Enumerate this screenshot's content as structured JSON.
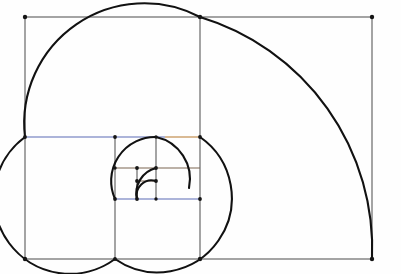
{
  "figure": {
    "name": "golden-spiral-diagram",
    "background_color": "#fefefe",
    "canvas": {
      "width": 401,
      "height": 274
    },
    "colors": {
      "spiral_stroke": "#111111",
      "outer_rect_stroke": "#4a4a4a",
      "divider_stroke": "#4a4a4a",
      "blue_line": "#5b6bb5",
      "orange_line": "#b5762a",
      "brown_line": "#7a6550",
      "vertex_dot": "#151515",
      "background": "#fefefe"
    },
    "stroke_widths": {
      "spiral": 2.1,
      "rect": 1.0,
      "subdivision": 1.0
    }
  },
  "chart_data": {
    "type": "line",
    "subtitle": "Nested golden rectangles subdivided into squares with inscribed quarter-circle arcs",
    "xlabel": "",
    "ylabel": "",
    "xlim": [
      25,
      372
    ],
    "ylim": [
      17,
      259
    ],
    "grid": false,
    "legend": null,
    "annotations": [],
    "outer_rectangle": {
      "name": "outer-golden-rectangle",
      "x_left": 25,
      "y_top": 17,
      "x_right": 372,
      "y_bottom": 259,
      "width": 347,
      "height": 242,
      "aspect_ratio": 1.434
    },
    "squares": [
      {
        "index": 1,
        "name": "square-1-largest",
        "x_left": 25,
        "y_top": 17,
        "size": 242,
        "x_right": 200,
        "y_bottom": 259
      },
      {
        "index": 2,
        "name": "square-2",
        "x_left": 25,
        "y_top": 137,
        "size": 122,
        "x_right": 200,
        "y_bottom": 259
      },
      {
        "index": 3,
        "name": "square-3",
        "x_left": 115,
        "y_top": 137,
        "size": 85,
        "x_right": 200,
        "y_bottom": 222
      },
      {
        "index": 4,
        "name": "square-4",
        "x_left": 115,
        "y_top": 137,
        "size": 62,
        "x_right": 200,
        "y_bottom": 199
      },
      {
        "index": 5,
        "name": "square-5",
        "x_left": 156,
        "y_top": 168,
        "size": 44,
        "x_right": 200,
        "y_bottom": 199
      },
      {
        "index": 6,
        "name": "square-6",
        "x_left": 130,
        "y_top": 168,
        "size": 26,
        "x_right": 156,
        "y_bottom": 194
      },
      {
        "index": 7,
        "name": "square-7-smallest",
        "x_left": 130,
        "y_top": 180,
        "size": 15,
        "x_right": 145,
        "y_bottom": 195
      }
    ],
    "subdivision_lines": [
      {
        "name": "divider-vertical-main",
        "orientation": "vertical",
        "x": 200,
        "y1": 17,
        "y2": 259,
        "color": "#4a4a4a"
      },
      {
        "name": "divider-horizontal-blue-upper",
        "orientation": "horizontal",
        "y": 137,
        "x1": 25,
        "x2": 165,
        "color": "#5b6bb5"
      },
      {
        "name": "divider-horizontal-orange-upper",
        "orientation": "horizontal",
        "y": 137,
        "x1": 165,
        "x2": 200,
        "color": "#b5762a"
      },
      {
        "name": "divider-vertical-inner-1",
        "orientation": "vertical",
        "x": 115,
        "y1": 137,
        "y2": 259,
        "color": "#4a4a4a"
      },
      {
        "name": "divider-horizontal-blue-lower",
        "orientation": "horizontal",
        "y": 199,
        "x1": 115,
        "x2": 200,
        "color": "#5b6bb5"
      },
      {
        "name": "divider-vertical-inner-2",
        "orientation": "vertical",
        "x": 156,
        "y1": 137,
        "y2": 199,
        "color": "#4a4a4a"
      },
      {
        "name": "divider-horizontal-brown-1",
        "orientation": "horizontal",
        "y": 168,
        "x1": 115,
        "x2": 200,
        "color": "#7a6550"
      },
      {
        "name": "divider-vertical-inner-3",
        "orientation": "vertical",
        "x": 137,
        "y1": 168,
        "y2": 199,
        "color": "#4a4a4a"
      },
      {
        "name": "divider-horizontal-brown-2",
        "orientation": "horizontal",
        "y": 181,
        "x1": 137,
        "x2": 156,
        "color": "#7a6550"
      }
    ],
    "spiral_arcs": [
      {
        "index": 1,
        "name": "arc-innermost",
        "center_x": 156,
        "center_y": 168,
        "radius": 13,
        "start_deg": 90,
        "end_deg": 180
      },
      {
        "index": 2,
        "name": "arc-2",
        "center_x": 156,
        "center_y": 199,
        "radius": 31,
        "start_deg": 0,
        "end_deg": 90
      },
      {
        "index": 3,
        "name": "arc-3",
        "center_x": 115,
        "center_y": 199,
        "radius": 62,
        "start_deg": 270,
        "end_deg": 360
      },
      {
        "index": 4,
        "name": "arc-4",
        "center_x": 200,
        "center_y": 137,
        "radius": 122,
        "start_deg": 90,
        "end_deg": 180
      },
      {
        "index": 5,
        "name": "arc-5-outer",
        "center_x": 200,
        "center_y": 17,
        "radius": 242,
        "start_deg": 0,
        "end_deg": 90
      }
    ],
    "vertices": [
      {
        "name": "vertex-outer-top-left",
        "x": 25,
        "y": 17
      },
      {
        "name": "vertex-outer-top-mid",
        "x": 200,
        "y": 17
      },
      {
        "name": "vertex-outer-top-right",
        "x": 372,
        "y": 17
      },
      {
        "name": "vertex-outer-bottom-left",
        "x": 25,
        "y": 259
      },
      {
        "name": "vertex-outer-bottom-mid",
        "x": 200,
        "y": 259
      },
      {
        "name": "vertex-outer-bottom-right",
        "x": 372,
        "y": 259
      },
      {
        "name": "vertex-left-blue-start",
        "x": 25,
        "y": 137
      },
      {
        "name": "vertex-mid-blue-end",
        "x": 200,
        "y": 137
      },
      {
        "name": "vertex-inner-v1-top",
        "x": 115,
        "y": 137
      },
      {
        "name": "vertex-inner-v1-bottom",
        "x": 115,
        "y": 259
      },
      {
        "name": "vertex-blue-lower-left",
        "x": 115,
        "y": 199
      },
      {
        "name": "vertex-blue-lower-right",
        "x": 200,
        "y": 199
      },
      {
        "name": "vertex-inner-v2-top",
        "x": 156,
        "y": 137
      },
      {
        "name": "vertex-inner-v2-bottom",
        "x": 156,
        "y": 199
      },
      {
        "name": "vertex-brown1-left",
        "x": 115,
        "y": 168
      },
      {
        "name": "vertex-brown1-mid",
        "x": 137,
        "y": 168
      },
      {
        "name": "vertex-brown1-right",
        "x": 156,
        "y": 168
      },
      {
        "name": "vertex-brown2-left",
        "x": 137,
        "y": 181
      },
      {
        "name": "vertex-brown2-right",
        "x": 156,
        "y": 181
      },
      {
        "name": "vertex-inner-v3-bottom",
        "x": 137,
        "y": 199
      }
    ]
  }
}
